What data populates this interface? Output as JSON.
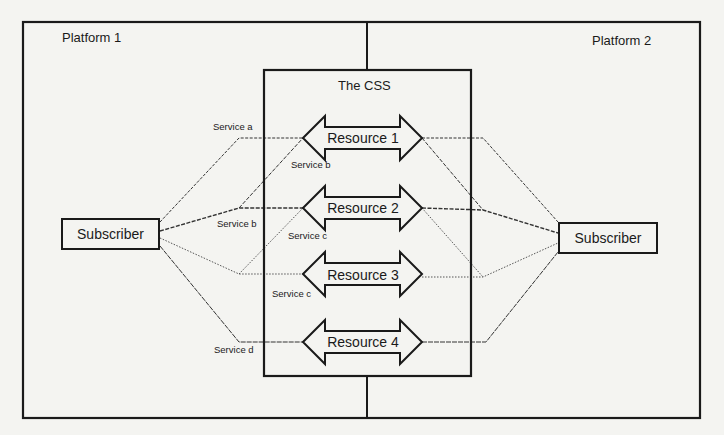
{
  "diagram": {
    "platforms": [
      {
        "label": "Platform 1"
      },
      {
        "label": "Platform 2"
      }
    ],
    "css_box": {
      "label": "The CSS"
    },
    "resources": [
      {
        "label": "Resource 1"
      },
      {
        "label": "Resource 2"
      },
      {
        "label": "Resource 3"
      },
      {
        "label": "Resource 4"
      }
    ],
    "subscribers": [
      {
        "label": "Subscriber",
        "side": "left"
      },
      {
        "label": "Subscriber",
        "side": "right"
      }
    ],
    "service_labels": [
      {
        "label": "Service a"
      },
      {
        "label": "Service b"
      },
      {
        "label": "Service b"
      },
      {
        "label": "Service c"
      },
      {
        "label": "Service c"
      },
      {
        "label": "Service d"
      }
    ],
    "connections": [
      {
        "from": "Subscriber (Platform 1)",
        "via": "Service a",
        "to": "Resource 1"
      },
      {
        "from": "Subscriber (Platform 1)",
        "via": "Service b",
        "to": "Resource 1"
      },
      {
        "from": "Subscriber (Platform 1)",
        "via": "Service b",
        "to": "Resource 2"
      },
      {
        "from": "Subscriber (Platform 1)",
        "via": "Service c",
        "to": "Resource 2"
      },
      {
        "from": "Subscriber (Platform 1)",
        "via": "Service c",
        "to": "Resource 3"
      },
      {
        "from": "Subscriber (Platform 1)",
        "via": "Service d",
        "to": "Resource 4"
      },
      {
        "from": "Resource 1",
        "to": "Subscriber (Platform 2)"
      },
      {
        "from": "Resource 2",
        "to": "Subscriber (Platform 2)"
      },
      {
        "from": "Resource 3",
        "to": "Subscriber (Platform 2)"
      },
      {
        "from": "Resource 4",
        "to": "Subscriber (Platform 2)"
      }
    ]
  }
}
